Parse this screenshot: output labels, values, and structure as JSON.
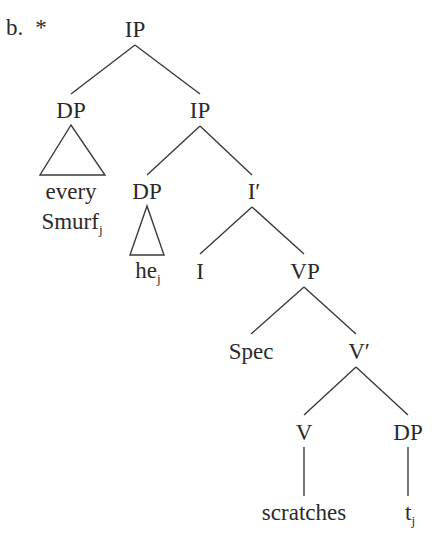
{
  "example": {
    "label": "b.",
    "judgment": "*"
  },
  "tree": {
    "root": "IP",
    "nodes": {
      "ip_root": {
        "label": "IP"
      },
      "dp_quant": {
        "label": "DP"
      },
      "ip_inner": {
        "label": "IP"
      },
      "quant_word1": {
        "label": "every"
      },
      "quant_word2": {
        "label": "Smurf",
        "index": "j"
      },
      "dp_pron": {
        "label": "DP"
      },
      "pron": {
        "label": "he",
        "index": "j"
      },
      "ibar": {
        "label": "I′"
      },
      "i_head": {
        "label": "I"
      },
      "vp": {
        "label": "VP"
      },
      "spec": {
        "label": "Spec"
      },
      "vbar": {
        "label": "V′"
      },
      "v_head": {
        "label": "V"
      },
      "dp_obj": {
        "label": "DP"
      },
      "verb": {
        "label": "scratches"
      },
      "trace": {
        "label": "t",
        "index": "j"
      }
    },
    "structure": [
      "[IP [DP every Smurf_j] [IP [DP he_j] [I′ [I] [VP [Spec] [V′ [V scratches] [DP t_j]]]]]]"
    ]
  },
  "colors": {
    "ink": "#2a2a2a",
    "background": "#ffffff"
  }
}
